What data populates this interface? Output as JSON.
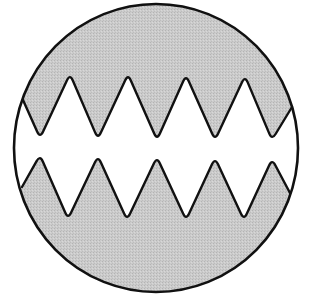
{
  "figure": {
    "title": "Circular field with interlocking zigzag teeth",
    "colors": {
      "background": "#ffffff",
      "fill": "#c8c8c8",
      "stroke": "#111111",
      "gap": "#ffffff"
    },
    "circle": {
      "cx": 156,
      "cy": 148,
      "rx": 142,
      "ry": 144,
      "stroke_width": 2.6
    },
    "upper_band": {
      "description": "Shaded upper region whose lower edge is a zigzag with 4 peaks and 5 valleys",
      "peaks": [
        [
          70,
          74
        ],
        [
          128,
          74
        ],
        [
          186,
          75
        ],
        [
          245,
          76
        ]
      ],
      "valleys": [
        [
          40,
          138
        ],
        [
          98,
          139
        ],
        [
          157,
          140
        ],
        [
          215,
          140
        ],
        [
          272,
          140
        ]
      ],
      "left_end": [
        23,
        100
      ],
      "right_end": [
        292,
        107
      ]
    },
    "lower_band": {
      "description": "Shaded lower region whose upper edge is a zigzag with 5 peaks and 4 valleys",
      "peaks": [
        [
          40,
          155
        ],
        [
          98,
          156
        ],
        [
          157,
          157
        ],
        [
          215,
          158
        ],
        [
          272,
          159
        ]
      ],
      "valleys": [
        [
          68,
          219
        ],
        [
          127,
          220
        ],
        [
          186,
          220
        ],
        [
          244,
          220
        ]
      ],
      "left_end": [
        22,
        187
      ],
      "right_end": [
        290,
        193
      ]
    }
  }
}
